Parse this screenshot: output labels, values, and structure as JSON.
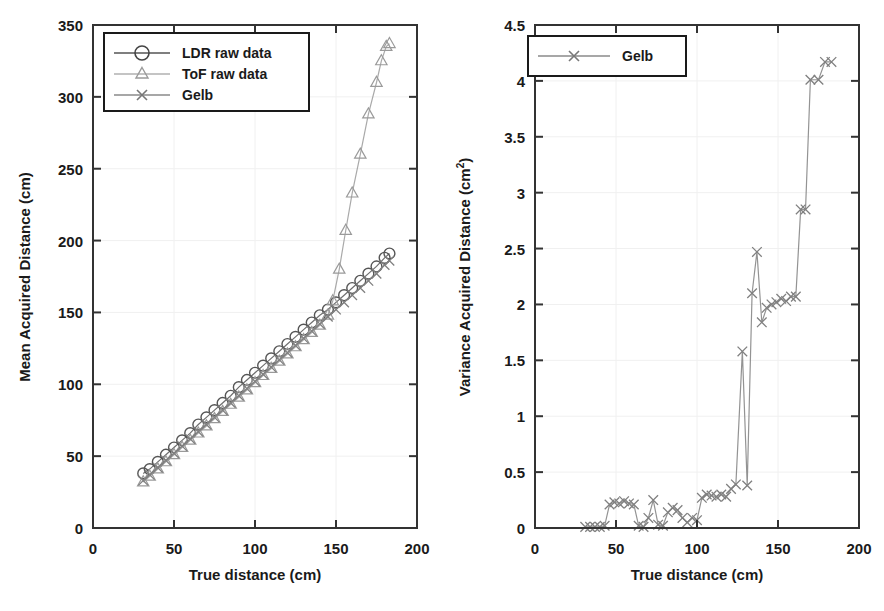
{
  "figure": {
    "background": "#ffffff",
    "panels": [
      "left",
      "right"
    ]
  },
  "chart_data": [
    {
      "id": "left",
      "type": "line",
      "title": "",
      "xlabel": "True distance (cm)",
      "ylabel": "Mean Acquired Distance (cm)",
      "xlim": [
        0,
        200
      ],
      "ylim": [
        0,
        350
      ],
      "xticks": [
        0,
        50,
        100,
        150,
        200
      ],
      "yticks": [
        0,
        50,
        100,
        150,
        200,
        250,
        300,
        350
      ],
      "xtick_labels": [
        "0",
        "50",
        "100",
        "150",
        "200"
      ],
      "ytick_labels": [
        "0",
        "50",
        "100",
        "150",
        "200",
        "250",
        "300",
        "350"
      ],
      "grid": true,
      "legend_position": "upper-left",
      "series": [
        {
          "name": "LDR raw data",
          "marker": "circle",
          "color": "#555555",
          "x": [
            31,
            35,
            40,
            45,
            50,
            55,
            60,
            65,
            70,
            75,
            80,
            85,
            90,
            95,
            100,
            105,
            110,
            115,
            120,
            125,
            130,
            135,
            140,
            145,
            150,
            155,
            160,
            165,
            170,
            175,
            180,
            183
          ],
          "y": [
            38,
            41,
            46,
            51,
            56,
            61,
            66,
            72,
            77,
            82,
            87,
            92,
            98,
            103,
            108,
            113,
            118,
            123,
            128,
            133,
            138,
            143,
            148,
            152,
            157,
            162,
            167,
            172,
            177,
            182,
            188,
            191
          ]
        },
        {
          "name": "ToF raw data",
          "marker": "triangle",
          "color": "#9a9a9a",
          "x": [
            31,
            35,
            40,
            45,
            50,
            55,
            60,
            65,
            70,
            75,
            80,
            85,
            90,
            95,
            100,
            105,
            110,
            115,
            120,
            125,
            130,
            135,
            140,
            145,
            148,
            152,
            156,
            160,
            165,
            170,
            175,
            178,
            181,
            183
          ],
          "y": [
            32,
            36,
            41,
            46,
            51,
            56,
            61,
            66,
            71,
            76,
            81,
            86,
            91,
            96,
            101,
            106,
            111,
            116,
            121,
            126,
            131,
            136,
            141,
            148,
            158,
            180,
            207,
            233,
            260,
            288,
            310,
            325,
            335,
            337
          ]
        },
        {
          "name": "Gelb",
          "marker": "x",
          "color": "#808080",
          "x": [
            31,
            35,
            40,
            45,
            50,
            55,
            60,
            65,
            70,
            75,
            80,
            85,
            90,
            95,
            100,
            105,
            110,
            115,
            120,
            125,
            130,
            135,
            140,
            145,
            150,
            155,
            160,
            165,
            170,
            175,
            180,
            183
          ],
          "y": [
            33,
            37,
            42,
            47,
            52,
            57,
            62,
            67,
            72,
            77,
            82,
            87,
            92,
            97,
            102,
            107,
            112,
            117,
            122,
            127,
            132,
            137,
            142,
            147,
            152,
            157,
            162,
            167,
            172,
            177,
            183,
            186
          ]
        }
      ]
    },
    {
      "id": "right",
      "type": "line",
      "title": "",
      "xlabel": "True distance (cm)",
      "ylabel": "Variance Acquired Distance (cm",
      "ylabel_sup": "2",
      "ylabel_suffix": ")",
      "xlim": [
        0,
        200
      ],
      "ylim": [
        0,
        4.5
      ],
      "xticks": [
        0,
        50,
        100,
        150,
        200
      ],
      "yticks": [
        0,
        0.5,
        1,
        1.5,
        2,
        2.5,
        3,
        3.5,
        4,
        4.5
      ],
      "xtick_labels": [
        "0",
        "50",
        "100",
        "150",
        "200"
      ],
      "ytick_labels": [
        "0",
        "0.5",
        "1",
        "1.5",
        "2",
        "2.5",
        "3",
        "3.5",
        "4",
        "4.5"
      ],
      "grid": true,
      "legend_position": "upper-left",
      "series": [
        {
          "name": "Gelb",
          "marker": "x",
          "color": "#808080",
          "x": [
            31,
            34,
            37,
            40,
            43,
            46,
            49,
            52,
            55,
            58,
            61,
            64,
            67,
            70,
            73,
            76,
            79,
            82,
            85,
            88,
            91,
            94,
            97,
            100,
            103,
            106,
            109,
            112,
            115,
            118,
            121,
            124,
            128,
            131,
            134,
            137,
            140,
            143,
            146,
            149,
            152,
            155,
            158,
            161,
            164,
            167,
            170,
            175,
            179,
            183
          ],
          "y": [
            0.01,
            0.01,
            0.01,
            0.01,
            0.02,
            0.21,
            0.23,
            0.22,
            0.24,
            0.22,
            0.21,
            0.02,
            0.01,
            0.09,
            0.25,
            0.03,
            0.02,
            0.14,
            0.18,
            0.16,
            0.09,
            0.05,
            0.09,
            0.07,
            0.27,
            0.3,
            0.29,
            0.28,
            0.3,
            0.28,
            0.35,
            0.39,
            1.58,
            0.38,
            2.1,
            2.47,
            1.84,
            1.97,
            2.0,
            2.02,
            2.05,
            2.03,
            2.07,
            2.07,
            2.85,
            2.85,
            4.01,
            4.01,
            4.17,
            4.17
          ]
        }
      ]
    }
  ],
  "left_panel": {
    "ylabel": "Mean Acquired Distance (cm)",
    "xlabel": "True distance (cm)",
    "legend": [
      {
        "label": "LDR raw data",
        "marker": "circle-marker"
      },
      {
        "label": "ToF raw data",
        "marker": "triangle-marker"
      },
      {
        "label": "Gelb",
        "marker": "x-marker"
      }
    ]
  },
  "right_panel": {
    "ylabel_main": "Variance Acquired Distance (cm",
    "ylabel_sup": "2",
    "ylabel_close": ")",
    "xlabel": "True distance (cm)",
    "legend": [
      {
        "label": "Gelb",
        "marker": "x-marker"
      }
    ]
  }
}
